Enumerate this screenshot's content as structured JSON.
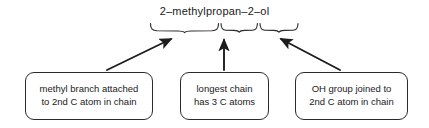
{
  "diagram": {
    "title": "2–methylpropan–2–ol",
    "stroke_color": "#2b2b2b",
    "text_color": "#1a1a1a",
    "background_color": "#ffffff",
    "braces": [
      {
        "name": "propan-stem-brace",
        "label": ""
      },
      {
        "name": "position-2-brace",
        "label": ""
      },
      {
        "name": "ol-suffix-brace",
        "label": ""
      }
    ],
    "callouts": [
      {
        "name": "methyl-branch",
        "line1": "methyl branch attached",
        "line2": "to 2nd C atom in chain"
      },
      {
        "name": "longest-chain",
        "line1": "longest chain",
        "line2": "has 3 C atoms"
      },
      {
        "name": "oh-group",
        "line1": "OH group joined to",
        "line2": "2nd C atom in chain"
      }
    ],
    "arrows": [
      {
        "name": "arrow-to-methyl-segment",
        "direction": "up-right"
      },
      {
        "name": "arrow-to-chain-segment",
        "direction": "up"
      },
      {
        "name": "arrow-to-oh-segment",
        "direction": "up-left"
      }
    ]
  }
}
